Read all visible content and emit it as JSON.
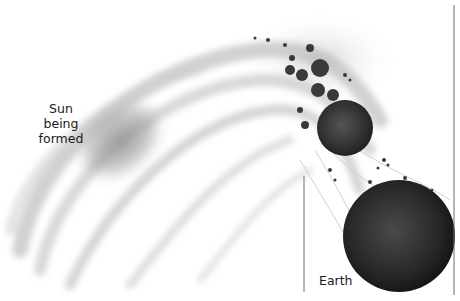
{
  "labels": {
    "sun": "Sun being\nformed",
    "sun_line1": "Sun being",
    "sun_line2": "formed",
    "earth": "Earth"
  },
  "colors": {
    "background": "#ffffff",
    "disc": "#9a9a9a",
    "planet": "#2a2a2a",
    "rock": "#3a3a3a",
    "line": "#6e6e6e"
  }
}
